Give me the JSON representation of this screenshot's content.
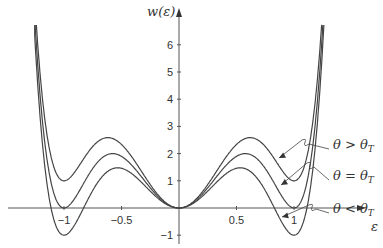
{
  "chart_data": {
    "type": "line",
    "title": "",
    "xlabel": "ε",
    "ylabel": "w(ε)",
    "xlim": [
      -1.3,
      1.4
    ],
    "ylim": [
      -1.2,
      6.8
    ],
    "x_ticks": [
      "-1",
      "-0.5",
      "0.5",
      "1"
    ],
    "y_ticks": [
      "-1",
      "1",
      "2",
      "3",
      "4",
      "5",
      "6"
    ],
    "grid": false,
    "series": [
      {
        "name": "θ > θT",
        "label_main": "θ > θ",
        "label_sub": "T",
        "shift": 1,
        "minimum_at_pm1": 1,
        "peak": 2.6
      },
      {
        "name": "θ = θT",
        "label_main": "θ = θ",
        "label_sub": "T",
        "shift": 0,
        "minimum_at_pm1": 0,
        "peak": 2.0
      },
      {
        "name": "θ < θT",
        "label_main": "θ < θ",
        "label_sub": "T",
        "shift": -1,
        "minimum_at_pm1": -1,
        "peak": 1.45
      }
    ],
    "points_sampled": {
      "x": [
        -1.25,
        -1.0,
        -0.58,
        0,
        0.58,
        1.0,
        1.25
      ],
      "θ > θT": [
        6.9,
        1.0,
        2.6,
        0,
        2.6,
        1.0,
        6.9
      ],
      "θ = θT": [
        6.7,
        0.0,
        2.0,
        0,
        2.0,
        0.0,
        6.7
      ],
      "θ < θT": [
        6.5,
        -1.0,
        1.45,
        0,
        1.45,
        -1.0,
        6.5
      ]
    }
  },
  "labels": {
    "ylabel": "w(ε)",
    "xlabel": "ε"
  }
}
